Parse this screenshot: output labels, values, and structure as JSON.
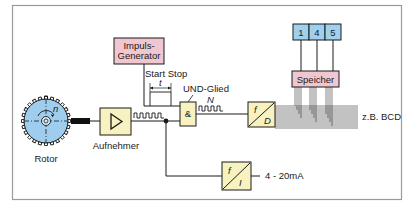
{
  "diagram": {
    "type": "block-diagram",
    "title": "",
    "colors": {
      "frame": "#9a9a9a",
      "line": "#1a1a1a",
      "block_yellow": "#f7f2c0",
      "block_pink": "#f0c6d0",
      "block_blue": "#9fd0ee",
      "rotor_blue": "#9fcdee"
    },
    "nodes": [
      {
        "id": "rotor",
        "label": "Rotor",
        "symbol": "n"
      },
      {
        "id": "aufnehmer",
        "label": "Aufnehmer",
        "symbol": "amplifier-triangle"
      },
      {
        "id": "impuls",
        "label_line1": "Impuls-",
        "label_line2": "Generator"
      },
      {
        "id": "und",
        "label": "UND-Glied",
        "symbol": "&"
      },
      {
        "id": "fd",
        "top": "f",
        "bottom": "D"
      },
      {
        "id": "fi",
        "top": "f",
        "bottom": "I"
      },
      {
        "id": "speicher",
        "label": "Speicher"
      },
      {
        "id": "display",
        "digits": [
          "1",
          "4",
          "5"
        ]
      }
    ],
    "labels": {
      "start_stop": "Start Stop",
      "t": "t",
      "n_pulses": "N",
      "bcd": "z.B. BCD",
      "current": "4 - 20mA"
    },
    "edges": [
      {
        "from": "rotor",
        "to": "aufnehmer"
      },
      {
        "from": "aufnehmer",
        "to": "und"
      },
      {
        "from": "impuls",
        "to": "und",
        "label": "Start Stop"
      },
      {
        "from": "und",
        "to": "fd",
        "label": "N"
      },
      {
        "from": "aufnehmer",
        "to": "fi"
      },
      {
        "from": "fd",
        "to": "speicher"
      },
      {
        "from": "speicher",
        "to": "display"
      },
      {
        "from": "fd",
        "to": "bcd-output",
        "label": "z.B. BCD"
      },
      {
        "from": "fi",
        "to": "current-output",
        "label": "4 - 20mA"
      }
    ]
  }
}
